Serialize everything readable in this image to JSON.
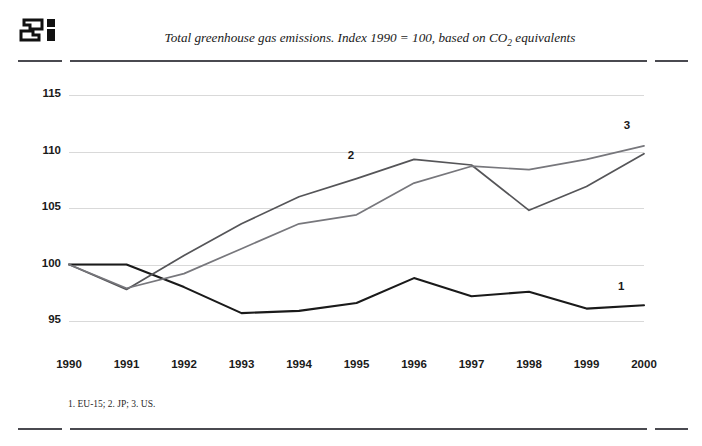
{
  "header": {
    "logo_name": "oecd-style-logo",
    "title_main": "Total greenhouse gas emissions. Index 1990 = 100, based on CO",
    "title_sub": "2",
    "title_tail": " equivalents",
    "title_full": "Total greenhouse gas emissions. Index 1990 = 100, based on CO2 equivalents"
  },
  "footnote": {
    "text": "1. EU-15; 2. JP; 3. US."
  },
  "colors": {
    "series1": "#1a1a1a",
    "series2": "#555558",
    "series3": "#77777c",
    "gridline": "#d9d9d9",
    "rule": "#4a4a50",
    "text": "#1a1a1a"
  },
  "chart_data": {
    "type": "line",
    "title": "Total greenhouse gas emissions. Index 1990 = 100, based on CO2 equivalents",
    "xlabel": "",
    "ylabel": "",
    "x": [
      1990,
      1991,
      1992,
      1993,
      1994,
      1995,
      1996,
      1997,
      1998,
      1999,
      2000
    ],
    "categories": [
      "1990",
      "1991",
      "1992",
      "1993",
      "1994",
      "1995",
      "1996",
      "1997",
      "1998",
      "1999",
      "2000"
    ],
    "xlim": [
      1990,
      2000
    ],
    "ylim": [
      93.5,
      116.5
    ],
    "yticks": [
      95,
      100,
      105,
      110,
      115
    ],
    "ytick_labels": [
      "95",
      "100",
      "105",
      "110",
      "115"
    ],
    "grid": true,
    "legend": "inline-endpoint-labels",
    "series": [
      {
        "name": "1",
        "label": "1",
        "note": "EU-15",
        "color": "#1a1a1a",
        "values": [
          100.0,
          100.0,
          98.0,
          95.7,
          95.9,
          96.6,
          98.8,
          97.2,
          97.6,
          96.1,
          96.4
        ]
      },
      {
        "name": "2",
        "label": "2",
        "note": "JP",
        "color": "#555558",
        "values": [
          100.0,
          97.8,
          100.8,
          103.6,
          106.0,
          107.6,
          109.3,
          108.8,
          104.8,
          106.9,
          109.8
        ]
      },
      {
        "name": "3",
        "label": "3",
        "note": "US",
        "color": "#77777c",
        "values": [
          100.0,
          97.9,
          99.2,
          101.4,
          103.6,
          104.4,
          107.2,
          108.7,
          108.4,
          109.3,
          110.5
        ]
      }
    ],
    "annotations": [
      {
        "text": "1",
        "x": 1999.6,
        "y": 97.9
      },
      {
        "text": "2",
        "x": 1994.9,
        "y": 109.5
      },
      {
        "text": "3",
        "x": 1999.7,
        "y": 112.2
      }
    ]
  }
}
